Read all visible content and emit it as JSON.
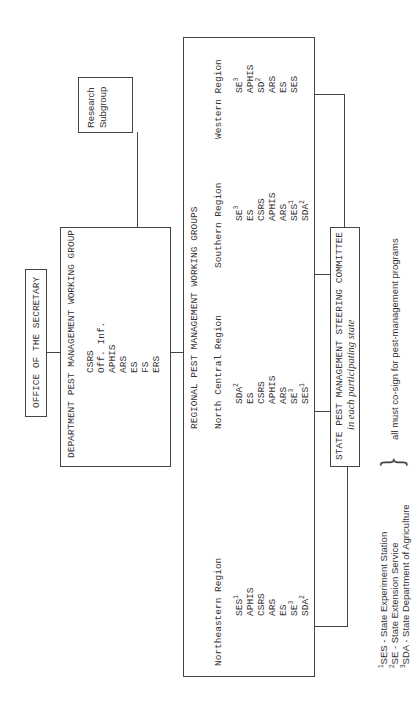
{
  "office": {
    "label": "OFFICE OF THE SECRETARY"
  },
  "department": {
    "title": "DEPARTMENT PEST MANAGEMENT WORKING GROUP",
    "members": [
      "CSRS",
      "Off. Inf.",
      "APHIS",
      "ARS",
      "ES",
      "FS",
      "ERS"
    ]
  },
  "research": {
    "line1": "Research",
    "line2": "Subgroup"
  },
  "regional": {
    "title": "REGIONAL PEST MANAGEMENT WORKING GROUPS",
    "regions": [
      {
        "name": "Northeastern Region",
        "members": [
          {
            "text": "SES",
            "sup": "1"
          },
          {
            "text": "APHIS",
            "sup": ""
          },
          {
            "text": "CSRS",
            "sup": ""
          },
          {
            "text": "ARS",
            "sup": ""
          },
          {
            "text": "ES",
            "sup": ""
          },
          {
            "text": "SE",
            "sup": "3"
          },
          {
            "text": "SDA",
            "sup": "2"
          }
        ]
      },
      {
        "name": "North Central Region",
        "members": [
          {
            "text": "SDA",
            "sup": "2"
          },
          {
            "text": "ES",
            "sup": ""
          },
          {
            "text": "CSRS",
            "sup": ""
          },
          {
            "text": "APHIS",
            "sup": ""
          },
          {
            "text": "ARS",
            "sup": ""
          },
          {
            "text": "SE",
            "sup": "3"
          },
          {
            "text": "SES",
            "sup": "1"
          }
        ]
      },
      {
        "name": "Southern Region",
        "members": [
          {
            "text": "SE",
            "sup": "3"
          },
          {
            "text": "ES",
            "sup": ""
          },
          {
            "text": "CSRS",
            "sup": ""
          },
          {
            "text": "APHIS",
            "sup": ""
          },
          {
            "text": "ARS",
            "sup": ""
          },
          {
            "text": "SES",
            "sup": "1"
          },
          {
            "text": "SDA",
            "sup": "2"
          }
        ]
      },
      {
        "name": "Western Region",
        "members": [
          {
            "text": "SE",
            "sup": "3"
          },
          {
            "text": "APHIS",
            "sup": ""
          },
          {
            "text": "SD",
            "sup": "2"
          },
          {
            "text": "ARS",
            "sup": ""
          },
          {
            "text": "ES",
            "sup": ""
          },
          {
            "text": "SES",
            "sup": ""
          }
        ]
      }
    ]
  },
  "state": {
    "title": "STATE PEST MANAGEMENT STEERING COMMITTEE",
    "subtitle": "in each participating state"
  },
  "footnotes": [
    {
      "num": "1",
      "text": "SES  - State Experiment Station"
    },
    {
      "num": "2",
      "text": "SE   - State Extension Service"
    },
    {
      "num": "3",
      "text": "SDA - State Department of Agriculture"
    }
  ],
  "cosign": "all must co-sign for pest-management programs"
}
